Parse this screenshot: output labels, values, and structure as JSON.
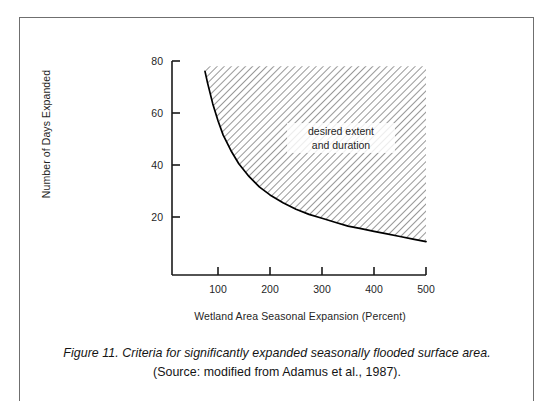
{
  "figure": {
    "caption_line1": "Figure 11.  Criteria for significantly expanded seasonally flooded surface area.",
    "caption_line2": "(Source:  modified from Adamus et al., 1987)."
  },
  "chart_data": {
    "type": "area",
    "title": "",
    "xlabel": "Wetland Area Seasonal Expansion (Percent)",
    "ylabel": "Number of Days Expanded",
    "xlim": [
      0,
      520
    ],
    "ylim": [
      0,
      88
    ],
    "xticks": [
      100,
      200,
      300,
      400,
      500
    ],
    "xtick_labels": [
      "100",
      "200",
      "300",
      "400",
      "500"
    ],
    "yticks": [
      20,
      40,
      60,
      80
    ],
    "ytick_labels": [
      "20",
      "40",
      "60",
      "80"
    ],
    "grid": false,
    "legend": "none",
    "annotations": [
      {
        "text_line1": "desired extent",
        "text_line2": "and duration",
        "x": 330,
        "y": 52
      }
    ],
    "series": [
      {
        "name": "threshold curve",
        "style": "solid-black-line",
        "x": [
          75,
          80,
          90,
          100,
          110,
          125,
          140,
          160,
          180,
          200,
          225,
          250,
          275,
          300,
          325,
          350,
          375,
          400,
          425,
          450,
          475,
          500
        ],
        "values": [
          76,
          71.5,
          63.5,
          57,
          51.5,
          45.5,
          40.5,
          35.5,
          31.5,
          28.5,
          25.5,
          23,
          21,
          19.5,
          18,
          16.5,
          15.5,
          14.5,
          13.5,
          12.5,
          11.5,
          10.5
        ]
      }
    ],
    "shaded_region": {
      "label": "desired extent and duration",
      "fill": "diagonal-hatch",
      "hatch_direction": "backslash",
      "hatch_spacing_px": 5,
      "hatch_color": "#4a4a4a",
      "upper_bound_y": 78,
      "right_bound_x": 500,
      "lower_bound": "threshold curve"
    },
    "colors": {
      "axis": "#1a1a1a",
      "curve": "#000000",
      "hatch": "#4a4a4a",
      "frame": "#6f6f6f",
      "text": "#1f1f1f"
    }
  }
}
